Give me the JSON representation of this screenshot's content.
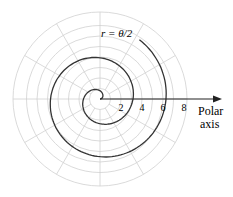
{
  "equation_label": "r = θ/2",
  "axis_label_line1": "Polar",
  "axis_label_line2": "axis",
  "tick_labels": [
    "2",
    "4",
    "6",
    "8"
  ],
  "colors": {
    "grid": "#d0d0d0",
    "curve": "#333333",
    "axis": "#222222"
  }
}
